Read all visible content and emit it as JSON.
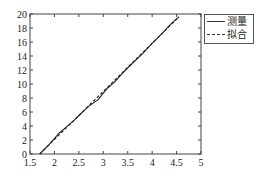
{
  "chart_data": {
    "type": "line",
    "title": "",
    "xlabel": "",
    "ylabel": "",
    "xlim": [
      1.5,
      5
    ],
    "ylim": [
      0,
      20
    ],
    "xticks": [
      "1.5",
      "2",
      "2.5",
      "3",
      "3.5",
      "4",
      "4.5",
      "5"
    ],
    "yticks": [
      "0",
      "2",
      "4",
      "6",
      "8",
      "10",
      "12",
      "14",
      "16",
      "18",
      "20"
    ],
    "grid": false,
    "legend_position": "outside-top-right",
    "series": [
      {
        "name": "测量",
        "style": "solid",
        "x": [
          1.7,
          1.9,
          2.0,
          2.1,
          2.2,
          2.3,
          2.4,
          2.5,
          2.7,
          2.9,
          3.0,
          3.1,
          3.2,
          3.3,
          3.4,
          3.6,
          3.8,
          4.0,
          4.2,
          4.4,
          4.55
        ],
        "y": [
          0.0,
          1.4,
          2.2,
          3.0,
          3.6,
          4.2,
          4.8,
          5.5,
          6.8,
          7.8,
          8.7,
          9.5,
          10.1,
          10.8,
          11.6,
          13.0,
          14.3,
          15.8,
          17.2,
          18.7,
          19.6
        ]
      },
      {
        "name": "拟合",
        "style": "dashed",
        "x": [
          1.7,
          4.55
        ],
        "y": [
          0.0,
          19.6
        ]
      }
    ]
  },
  "legend": {
    "items": [
      {
        "label": "测量",
        "style": "solid"
      },
      {
        "label": "拟合",
        "style": "dashed"
      }
    ]
  }
}
